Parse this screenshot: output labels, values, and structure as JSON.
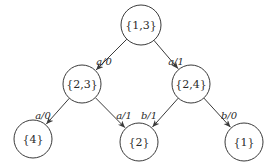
{
  "diagram": {
    "type": "tree",
    "colors": {
      "background": "#ffffff",
      "stroke": "#3a3a3a",
      "text": "#2a2a2a"
    },
    "nodes": [
      {
        "id": "n13",
        "label": "{1,3}",
        "cx": 141,
        "cy": 25,
        "r": 20
      },
      {
        "id": "n23",
        "label": "{2,3}",
        "cx": 82,
        "cy": 84,
        "r": 19
      },
      {
        "id": "n24",
        "label": "{2,4}",
        "cx": 191,
        "cy": 84,
        "r": 19
      },
      {
        "id": "n4",
        "label": "{4}",
        "cx": 33,
        "cy": 139,
        "r": 19
      },
      {
        "id": "n2",
        "label": "{2}",
        "cx": 139,
        "cy": 142,
        "r": 19
      },
      {
        "id": "n1",
        "label": "{1}",
        "cx": 244,
        "cy": 142,
        "r": 19
      }
    ],
    "edges": [
      {
        "from": "n13",
        "to": "n23",
        "label": "a/0",
        "lx": 104,
        "ly": 65
      },
      {
        "from": "n13",
        "to": "n24",
        "label": "a/1",
        "lx": 176,
        "ly": 65
      },
      {
        "from": "n23",
        "to": "n4",
        "label": "a/0",
        "lx": 43,
        "ly": 119
      },
      {
        "from": "n23",
        "to": "n2",
        "label": "a/1",
        "lx": 124,
        "ly": 119
      },
      {
        "from": "n24",
        "to": "n2",
        "label": "b/1",
        "lx": 149,
        "ly": 119
      },
      {
        "from": "n24",
        "to": "n1",
        "label": "b/0",
        "lx": 229,
        "ly": 119
      }
    ]
  }
}
